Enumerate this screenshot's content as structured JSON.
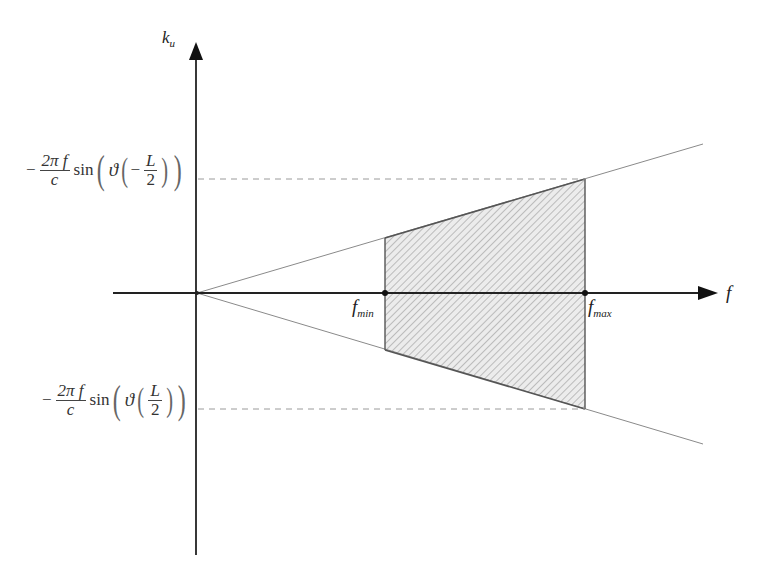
{
  "diagram": {
    "type": "frequency-wavenumber support region",
    "axes": {
      "vertical_label": {
        "main": "k",
        "sub": "u"
      },
      "horizontal_label": "f"
    },
    "points": [
      {
        "name": "f_min",
        "main": "f",
        "sub": "min"
      },
      {
        "name": "f_max",
        "main": "f",
        "sub": "max"
      }
    ],
    "upper_bound_label": {
      "sign": "−",
      "frac_num": "2π f",
      "frac_den": "c",
      "fn": "sin",
      "theta": "ϑ",
      "inner_sign": "−",
      "inner_num": "L",
      "inner_den": "2"
    },
    "lower_bound_label": {
      "sign": "−",
      "frac_num": "2π f",
      "frac_den": "c",
      "fn": "sin",
      "theta": "ϑ",
      "inner_sign": "",
      "inner_num": "L",
      "inner_den": "2"
    },
    "colors": {
      "axis": "#222222",
      "bound_line": "#8a8a8a",
      "hatch": "#9a9a9a",
      "fill": "#e6e6e6"
    }
  }
}
